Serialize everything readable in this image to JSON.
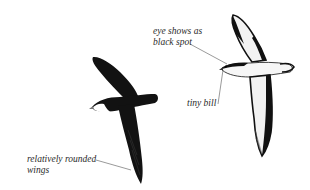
{
  "figure": {
    "background": "#ffffff",
    "ink_color": "#111111",
    "line_color": "#555555",
    "birds": [
      {
        "id": "dark-bird",
        "view": "upperside",
        "color": "#121212"
      },
      {
        "id": "white-bird",
        "view": "underside",
        "color": "#f4f4f4",
        "outline": "#111111"
      }
    ],
    "annotations": [
      {
        "id": "eye",
        "lines": [
          "eye shows as",
          "black spot"
        ]
      },
      {
        "id": "bill",
        "lines": [
          "tiny bill"
        ]
      },
      {
        "id": "wings",
        "lines": [
          "relatively rounded",
          "wings"
        ]
      }
    ]
  }
}
